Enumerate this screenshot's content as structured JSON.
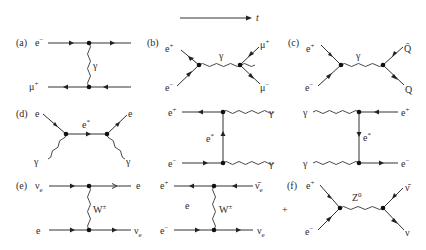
{
  "figure": {
    "time_axis": {
      "label": "t"
    },
    "panels": [
      {
        "id": "a",
        "tag": "(a)",
        "process": "e⁻ μ⁺ scattering (t-channel photon exchange)",
        "labels": {
          "top_left": "e",
          "top_left_sup": "−",
          "bottom_left": "μ",
          "bottom_left_sup": "+",
          "boson": "γ"
        }
      },
      {
        "id": "b",
        "tag": "(b)",
        "process": "e⁺e⁻ → μ⁺μ⁻ (s-channel photon)",
        "labels": {
          "in_top": "e",
          "in_top_sup": "+",
          "in_bottom": "e",
          "in_bottom_sup": "−",
          "boson": "γ",
          "out_top": "μ",
          "out_top_sup": "+",
          "out_bottom": "μ",
          "out_bottom_sup": "−"
        }
      },
      {
        "id": "c",
        "tag": "(c)",
        "process": "e⁺e⁻ → Q̄Q (s-channel photon)",
        "labels": {
          "in_top": "e",
          "in_top_sup": "+",
          "in_bottom": "e",
          "in_bottom_sup": "−",
          "boson": "γ",
          "out_top": "Q̄",
          "out_bottom": "Q"
        }
      },
      {
        "id": "d1",
        "tag": "(d)",
        "process": "Compton scattering (s-channel)",
        "labels": {
          "in_top": "e",
          "in_bottom": "γ",
          "propagator": "e",
          "propagator_sup": "*",
          "out_top": "e",
          "out_bottom": "γ"
        }
      },
      {
        "id": "d2",
        "tag": "",
        "process": "e⁺e⁻ → γγ (t-channel electron)",
        "labels": {
          "top_left": "e",
          "top_left_sup": "+",
          "bottom_left": "e",
          "bottom_left_sup": "−",
          "propagator": "e",
          "propagator_sup": "*",
          "top_right": "γ",
          "bottom_right": "γ"
        }
      },
      {
        "id": "d3",
        "tag": "",
        "process": "γγ → e⁺e⁻ (t-channel electron)",
        "labels": {
          "top_left": "γ",
          "bottom_left": "γ",
          "propagator": "e",
          "propagator_sup": "*",
          "top_right": "e",
          "top_right_sup": "+",
          "bottom_right": "e",
          "bottom_right_sup": "−"
        }
      },
      {
        "id": "e1",
        "tag": "(e)",
        "process": "νₑ e scattering (W exchange)",
        "labels": {
          "top_left": "ν",
          "top_left_sub": "e",
          "bottom_left": "e",
          "boson": "W",
          "boson_sup": "±",
          "top_right": "e",
          "bottom_right": "ν",
          "bottom_right_sub": "e"
        }
      },
      {
        "id": "e2",
        "tag": "",
        "process": "e⁺e⁻ → ν̄ₑνₑ (W exchange)",
        "labels": {
          "top_left": "e",
          "top_left_sup": "+",
          "bottom_left": "e",
          "bottom_left_sup": "−",
          "propagator": "e",
          "boson": "W",
          "boson_sup": "±",
          "top_right": "ν̄",
          "top_right_sub": "e",
          "bottom_right": "ν",
          "bottom_right_sub": "e"
        }
      },
      {
        "id": "f",
        "tag": "(f)",
        "process": "e⁺e⁻ → ν̄ν (s-channel Z⁰)",
        "plus_sign": "+",
        "labels": {
          "in_top": "e",
          "in_top_sup": "+",
          "in_bottom": "e",
          "in_bottom_sup": "−",
          "boson": "Z",
          "boson_sup": "0",
          "out_top": "ν̄",
          "out_bottom": "ν"
        }
      }
    ]
  }
}
